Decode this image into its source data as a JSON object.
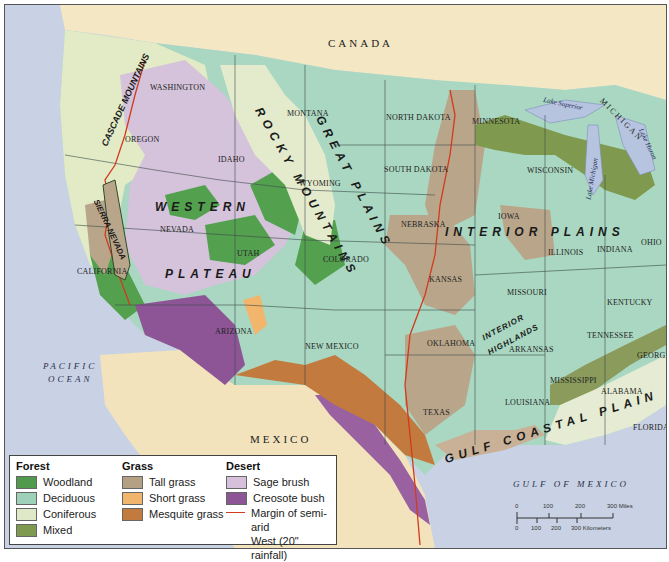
{
  "map": {
    "countries": {
      "canada": "CANADA",
      "mexico": "MEXICO"
    },
    "water": {
      "pacific": [
        "PACIFIC",
        "OCEAN"
      ],
      "gulf": "GULF OF MEXICO",
      "lake_superior": "Lake Superior",
      "lake_michigan": "Lake Michigan",
      "lake_huron": "Lake Huron"
    },
    "regions": {
      "cascade": "CASCADE MOUNTAINS",
      "sierra": "SIERRA NEVADA",
      "rocky": "ROCKY MOUNTAINS",
      "great_plains": "GREAT PLAINS",
      "western_plateau_1": "WESTERN",
      "western_plateau_2": "PLATEAU",
      "interior_plains": "INTERIOR PLAINS",
      "interior_highlands_1": "INTERIOR",
      "interior_highlands_2": "HIGHLANDS",
      "gulf_coastal_plain": "GULF COASTAL PLAIN"
    },
    "states": {
      "washington": "WASHINGTON",
      "oregon": "OREGON",
      "california": "CALIFORNIA",
      "idaho": "IDAHO",
      "nevada": "NEVADA",
      "utah": "UTAH",
      "arizona": "ARIZONA",
      "montana": "MONTANA",
      "wyoming": "WYOMING",
      "colorado": "COLORADO",
      "new_mexico": "NEW MEXICO",
      "north_dakota": "NORTH DAKOTA",
      "south_dakota": "SOUTH DAKOTA",
      "nebraska": "NEBRASKA",
      "kansas": "KANSAS",
      "oklahoma": "OKLAHOMA",
      "texas": "TEXAS",
      "minnesota": "MINNESOTA",
      "iowa": "IOWA",
      "missouri": "MISSOURI",
      "arkansas": "ARKANSAS",
      "louisiana": "LOUISIANA",
      "wisconsin": "WISCONSIN",
      "michigan": "MICHIGAN",
      "illinois": "ILLINOIS",
      "indiana": "INDIANA",
      "ohio": "OHIO",
      "kentucky": "KENTUCKY",
      "tennessee": "TENNESSEE",
      "mississippi": "MISSISSIPPI",
      "alabama": "ALABAMA",
      "georgia": "GEORGIA",
      "florida": "FLORIDA"
    },
    "rivers": {
      "columbia": "Columbia R.",
      "missouri": "Missouri R.",
      "snake": "Snake R.",
      "platte": "Platte R.",
      "arkansas": "Arkansas R.",
      "colorado": "Colorado R.",
      "gila": "Gila R.",
      "red": "Red R.",
      "pecos": "Pecos R.",
      "brazos": "Brazos R.",
      "rio_grande": "Rio Grande",
      "ohio": "Ohio R.",
      "mississippi": "Mississippi R."
    }
  },
  "legend": {
    "forest": {
      "title": "Forest",
      "items": [
        {
          "label": "Woodland",
          "color": "#4f9a4c"
        },
        {
          "label": "Deciduous",
          "color": "#9fd1b8"
        },
        {
          "label": "Coniferous",
          "color": "#dfe9c8"
        },
        {
          "label": "Mixed",
          "color": "#7f9a4e"
        }
      ]
    },
    "grass": {
      "title": "Grass",
      "items": [
        {
          "label": "Tall grass",
          "color": "#b4a184"
        },
        {
          "label": "Short grass",
          "color": "#f1b66c"
        },
        {
          "label": "Mesquite grass",
          "color": "#c27a3f"
        }
      ]
    },
    "desert": {
      "title": "Desert",
      "items": [
        {
          "label": "Sage brush",
          "color": "#d7c0dc"
        },
        {
          "label": "Creosote bush",
          "color": "#8e5596"
        }
      ],
      "line": {
        "label_1": "Margin of semi-arid",
        "label_2": "West (20\" rainfall)",
        "color": "#d23a1e"
      }
    }
  },
  "scale": {
    "miles_ticks": [
      "0",
      "100",
      "200",
      "300 Miles"
    ],
    "km_ticks": [
      "0",
      "100",
      "200",
      "300 Kilometers"
    ]
  }
}
